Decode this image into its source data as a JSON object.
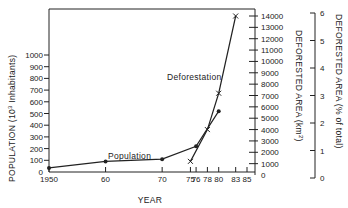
{
  "chart_data": {
    "type": "line",
    "title": "",
    "xlabel": "YEAR",
    "x_ticks": [
      "1950",
      "60",
      "70",
      "75",
      "76",
      "78",
      "80",
      "83",
      "85"
    ],
    "x_tick_values": [
      1950,
      1960,
      1970,
      1975,
      1976,
      1978,
      1980,
      1983,
      1985
    ],
    "xlim": [
      1950,
      1985
    ],
    "y_axes": [
      {
        "label": "POPULATION (10³ Inhabitants)",
        "position": "left",
        "ticks": [
          "0",
          "100",
          "200",
          "300",
          "400",
          "500",
          "600",
          "700",
          "800",
          "900",
          "1000"
        ],
        "ylim": [
          0,
          1000
        ]
      },
      {
        "label": "DEFORESTED AREA (km²)",
        "position": "right",
        "ticks": [
          "0",
          "1000",
          "2000",
          "3000",
          "4000",
          "5000",
          "6000",
          "7000",
          "8000",
          "9000",
          "10000",
          "11000",
          "12000",
          "13000",
          "14000"
        ],
        "ylim": [
          0,
          14000
        ]
      },
      {
        "label": "DEFORESTED AREA (% of total)",
        "position": "far-right",
        "ticks": [
          "0",
          "1",
          "2",
          "3",
          "4",
          "5",
          "6"
        ],
        "ylim": [
          0,
          6
        ]
      }
    ],
    "series": [
      {
        "name": "Population",
        "axis": "left",
        "marker": "dot",
        "x": [
          1950,
          1960,
          1970,
          1976,
          1980
        ],
        "values": [
          35,
          90,
          110,
          220,
          520
        ]
      },
      {
        "name": "Deforestation",
        "axis": "right",
        "marker": "x",
        "x": [
          1975,
          1978,
          1980,
          1983
        ],
        "values": [
          1200,
          4000,
          7200,
          14000
        ]
      }
    ],
    "annotations": [
      "Population",
      "Deforestation"
    ],
    "grid": false,
    "legend": "none (inline labels)"
  },
  "labels": {
    "xlabel": "YEAR",
    "ylabel_left": "POPULATION (10",
    "ylabel_left_sup": "3",
    "ylabel_left_end": " Inhabitants)",
    "ylabel_right": "DEFORESTED AREA (km",
    "ylabel_right_sup": "2",
    "ylabel_right_end": ")",
    "ylabel_far": "DEFORESTED AREA (% of total)",
    "series_pop": "Population",
    "series_def": "Deforestation"
  }
}
